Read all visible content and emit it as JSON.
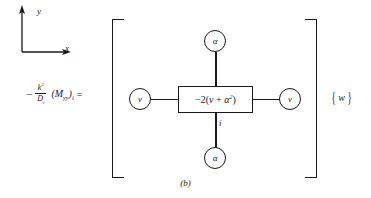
{
  "figure": {
    "caption": "(b)",
    "axes": {
      "x_label": "x",
      "y_label": "y"
    },
    "equation": {
      "minus": "−",
      "fraction_numerator": "k",
      "numerator_exponent": "2",
      "fraction_denominator": "D",
      "denominator_subscript": "i",
      "moment_term": "(M",
      "moment_subscript": "yy",
      "moment_close": ")",
      "moment_index": "i",
      "equals": "="
    },
    "stencil": {
      "center_box": {
        "coefficient": "−2(",
        "nu": "ν",
        "plus": " + ",
        "alpha": "α",
        "alpha_exponent": "2",
        "close": ")"
      },
      "node_top": "α",
      "node_bottom": "α",
      "node_left": "ν",
      "node_right": "ν",
      "index_label": "i"
    },
    "vector": {
      "open_brace": "{",
      "symbol": "w",
      "close_brace": "}"
    },
    "colors": {
      "ink": "#1a1a1a",
      "background": "#ffffff"
    }
  }
}
